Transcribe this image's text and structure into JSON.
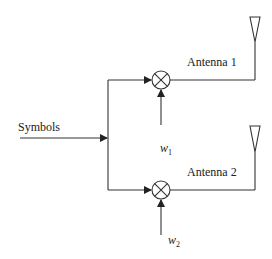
{
  "diagram": {
    "input_label": "Symbols",
    "branches": [
      {
        "antenna_label": "Antenna 1",
        "weight_label": "w",
        "weight_sub": "1"
      },
      {
        "antenna_label": "Antenna 2",
        "weight_label": "w",
        "weight_sub": "2"
      }
    ],
    "mixer_symbol": "multiplier-circle-x",
    "colors": {
      "line": "#333333",
      "text": "#222222",
      "background": "#ffffff"
    }
  }
}
